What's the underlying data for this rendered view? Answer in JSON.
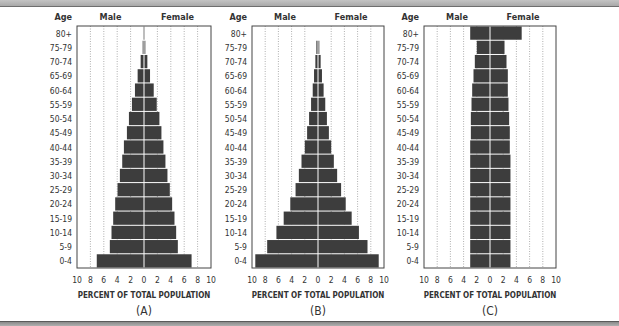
{
  "chart_data": [
    {
      "type": "bar",
      "orientation": "horizontal-pyramid",
      "caption": "(A)",
      "age_header": "Age",
      "left_header": "Male",
      "right_header": "Female",
      "xlabel": "PERCENT OF TOTAL POPULATION",
      "xticks": [
        "10",
        "8",
        "6",
        "4",
        "2",
        "0",
        "2",
        "4",
        "6",
        "8",
        "10"
      ],
      "xlim": [
        -10,
        10
      ],
      "grid": true,
      "categories": [
        "80+",
        "75-79",
        "70-74",
        "65-69",
        "60-64",
        "55-59",
        "50-54",
        "45-49",
        "40-44",
        "35-39",
        "30-34",
        "25-29",
        "20-24",
        "15-19",
        "10-14",
        "5-9",
        "0-4"
      ],
      "series": [
        {
          "name": "Male",
          "values": [
            0.1,
            0.2,
            0.5,
            0.95,
            1.35,
            1.8,
            2.25,
            2.55,
            3.0,
            3.25,
            3.6,
            3.95,
            4.3,
            4.6,
            4.85,
            5.1,
            7.05
          ]
        },
        {
          "name": "Female",
          "values": [
            0.1,
            0.2,
            0.5,
            0.9,
            1.45,
            1.9,
            2.3,
            2.6,
            2.9,
            3.2,
            3.5,
            3.85,
            4.2,
            4.55,
            4.8,
            5.05,
            7.1
          ]
        }
      ]
    },
    {
      "type": "bar",
      "orientation": "horizontal-pyramid",
      "caption": "(B)",
      "age_header": "Age",
      "left_header": "Male",
      "right_header": "Female",
      "xlabel": "PERCENT OF TOTAL POPULATION",
      "xticks": [
        "10",
        "8",
        "6",
        "4",
        "2",
        "0",
        "2",
        "4",
        "6",
        "8",
        "10"
      ],
      "xlim": [
        -10,
        10
      ],
      "grid": true,
      "categories": [
        "80+",
        "75-79",
        "70-74",
        "65-69",
        "60-64",
        "55-59",
        "50-54",
        "45-49",
        "40-44",
        "35-39",
        "30-34",
        "25-29",
        "20-24",
        "15-19",
        "10-14",
        "5-9",
        "0-4"
      ],
      "series": [
        {
          "name": "Male",
          "values": [
            0,
            0.25,
            0.4,
            0.6,
            0.8,
            1.05,
            1.35,
            1.65,
            2.0,
            2.5,
            2.9,
            3.4,
            4.2,
            5.2,
            6.3,
            7.7,
            9.5
          ]
        },
        {
          "name": "Female",
          "values": [
            0,
            0.2,
            0.4,
            0.6,
            0.85,
            1.1,
            1.35,
            1.65,
            2.0,
            2.4,
            2.9,
            3.5,
            4.2,
            5.1,
            6.2,
            7.5,
            9.2
          ]
        }
      ]
    },
    {
      "type": "bar",
      "orientation": "horizontal-pyramid",
      "caption": "(C)",
      "age_header": "Age",
      "left_header": "Male",
      "right_header": "Female",
      "xlabel": "PERCENT OF TOTAL POPULATION",
      "xticks": [
        "10",
        "8",
        "6",
        "4",
        "2",
        "0",
        "2",
        "4",
        "6",
        "8",
        "10"
      ],
      "xlim": [
        -10,
        10
      ],
      "grid": true,
      "categories": [
        "80+",
        "75-79",
        "70-74",
        "65-69",
        "60-64",
        "55-59",
        "50-54",
        "45-49",
        "40-44",
        "35-39",
        "30-34",
        "25-29",
        "20-24",
        "15-19",
        "10-14",
        "5-9",
        "0-4"
      ],
      "series": [
        {
          "name": "Male",
          "values": [
            3.0,
            2.0,
            2.3,
            2.5,
            2.7,
            2.8,
            2.9,
            2.9,
            3.0,
            3.0,
            3.0,
            3.0,
            3.0,
            3.0,
            3.0,
            3.0,
            3.0
          ]
        },
        {
          "name": "Female",
          "values": [
            4.8,
            2.2,
            2.5,
            2.7,
            2.7,
            2.8,
            2.9,
            3.0,
            3.0,
            3.1,
            3.1,
            3.1,
            3.1,
            3.1,
            3.1,
            3.1,
            3.1
          ]
        }
      ]
    }
  ],
  "colors": {
    "bar": "#3d3d3d",
    "grid": "#9a9a9a",
    "frame": "#444444",
    "center_line": "#ffffff"
  }
}
